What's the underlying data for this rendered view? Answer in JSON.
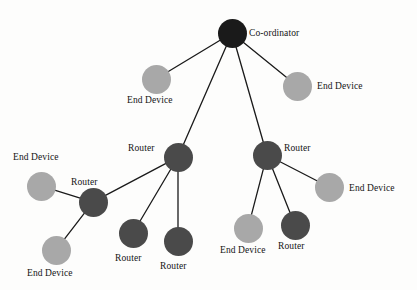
{
  "diagram": {
    "background_color": "#fdfdfc",
    "edge_color": "#1a1a1a",
    "node_types": {
      "coordinator": {
        "label": "Co-ordinator",
        "color": "#1a1a1a"
      },
      "router": {
        "label": "Router",
        "color": "#4a4a4a"
      },
      "end_device": {
        "label": "End Device",
        "color": "#a8a8a8"
      }
    },
    "nodes": [
      {
        "id": "coordinator",
        "type": "coordinator",
        "label": "Co-ordinator",
        "color": "#1a1a1a",
        "cx": 232,
        "cy": 33,
        "r": 14.5,
        "label_x": 249,
        "label_y": 28
      },
      {
        "id": "ed-top-left",
        "type": "end_device",
        "label": "End Device",
        "color": "#a8a8a8",
        "cx": 156,
        "cy": 79,
        "r": 14.5,
        "label_x": 127,
        "label_y": 95
      },
      {
        "id": "ed-top-right",
        "type": "end_device",
        "label": "End Device",
        "color": "#a8a8a8",
        "cx": 297,
        "cy": 86,
        "r": 14.5,
        "label_x": 317,
        "label_y": 81
      },
      {
        "id": "router-left",
        "type": "router",
        "label": "Router",
        "color": "#4a4a4a",
        "cx": 178,
        "cy": 157,
        "r": 14.5,
        "label_x": 128,
        "label_y": 143
      },
      {
        "id": "router-right",
        "type": "router",
        "label": "Router",
        "color": "#4a4a4a",
        "cx": 267,
        "cy": 155,
        "r": 14.5,
        "label_x": 284,
        "label_y": 143
      },
      {
        "id": "ed-far-left",
        "type": "end_device",
        "label": "End Device",
        "color": "#a8a8a8",
        "cx": 41,
        "cy": 186,
        "r": 14.5,
        "label_x": 13,
        "label_y": 152
      },
      {
        "id": "router-sub",
        "type": "router",
        "label": "Router",
        "color": "#4a4a4a",
        "cx": 93,
        "cy": 202,
        "r": 14.5,
        "label_x": 71,
        "label_y": 177
      },
      {
        "id": "ed-bot-left",
        "type": "end_device",
        "label": "End Device",
        "color": "#a8a8a8",
        "cx": 56,
        "cy": 250,
        "r": 14.5,
        "label_x": 27,
        "label_y": 268
      },
      {
        "id": "router-bot-1",
        "type": "router",
        "label": "Router",
        "color": "#4a4a4a",
        "cx": 133,
        "cy": 233,
        "r": 14.5,
        "label_x": 115,
        "label_y": 253
      },
      {
        "id": "router-bot-2",
        "type": "router",
        "label": "Router",
        "color": "#4a4a4a",
        "cx": 178,
        "cy": 241,
        "r": 14.5,
        "label_x": 160,
        "label_y": 261
      },
      {
        "id": "ed-bot-mid",
        "type": "end_device",
        "label": "End Device",
        "color": "#a8a8a8",
        "cx": 248,
        "cy": 228,
        "r": 14.5,
        "label_x": 220,
        "label_y": 245
      },
      {
        "id": "router-bot-3",
        "type": "router",
        "label": "Router",
        "color": "#4a4a4a",
        "cx": 295,
        "cy": 225,
        "r": 14.5,
        "label_x": 278,
        "label_y": 241
      },
      {
        "id": "ed-right",
        "type": "end_device",
        "label": "End Device",
        "color": "#a8a8a8",
        "cx": 329,
        "cy": 187,
        "r": 14.5,
        "label_x": 349,
        "label_y": 183
      }
    ],
    "edges": [
      {
        "from": "coordinator",
        "to": "ed-top-left"
      },
      {
        "from": "coordinator",
        "to": "router-left"
      },
      {
        "from": "coordinator",
        "to": "router-right"
      },
      {
        "from": "coordinator",
        "to": "ed-top-right"
      },
      {
        "from": "router-left",
        "to": "router-sub"
      },
      {
        "from": "router-left",
        "to": "router-bot-1"
      },
      {
        "from": "router-left",
        "to": "router-bot-2"
      },
      {
        "from": "router-sub",
        "to": "ed-far-left"
      },
      {
        "from": "router-sub",
        "to": "ed-bot-left"
      },
      {
        "from": "router-right",
        "to": "ed-right"
      },
      {
        "from": "router-right",
        "to": "ed-bot-mid"
      },
      {
        "from": "router-right",
        "to": "router-bot-3"
      }
    ]
  }
}
